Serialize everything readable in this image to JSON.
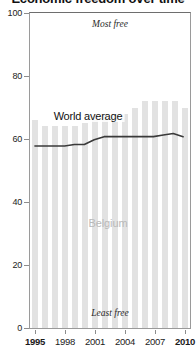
{
  "title": "Economic freedom over time",
  "chart_data": {
    "type": "bar",
    "title": "Economic freedom over time",
    "subtitle": "",
    "xlabel": "",
    "ylabel": "",
    "ylim": [
      0,
      100
    ],
    "xlim": [
      1994.5,
      2010.5
    ],
    "grid": false,
    "legend_position": "inline-annotations",
    "categories": [
      1995,
      1996,
      1997,
      1998,
      1999,
      2000,
      2001,
      2002,
      2003,
      2004,
      2005,
      2006,
      2007,
      2008,
      2009,
      2010
    ],
    "series": [
      {
        "name": "Belgium",
        "type": "bar",
        "color": "#e2e2e2",
        "values": [
          66,
          64,
          64,
          64,
          64,
          65,
          67,
          68,
          68,
          68,
          70,
          72,
          72,
          72,
          72,
          70
        ]
      },
      {
        "name": "World average",
        "type": "line",
        "color": "#3a3a3a",
        "values": [
          57.5,
          57.5,
          57.5,
          57.5,
          58,
          58,
          59.5,
          60.5,
          60.5,
          60.5,
          60.5,
          60.5,
          60.5,
          61,
          61.5,
          60.5
        ]
      }
    ],
    "annotations": [
      {
        "text": "Most free",
        "x": 2002.5,
        "y": 96,
        "style": "italic"
      },
      {
        "text": "Least free",
        "x": 2002.5,
        "y": 4,
        "style": "italic"
      },
      {
        "text": "World average",
        "x": 2000.3,
        "y": 67,
        "style": "series-label"
      },
      {
        "text": "Belgium",
        "x": 2002.3,
        "y": 33,
        "style": "country-label"
      }
    ],
    "yticks": [
      0,
      20,
      40,
      60,
      80,
      100
    ],
    "ytick_labels": [
      "0",
      "20",
      "40",
      "60",
      "80",
      "100"
    ],
    "xticks": [
      1995,
      1998,
      2001,
      2004,
      2007,
      2010
    ],
    "xtick_labels": [
      "1995",
      "1998",
      "2001",
      "2004",
      "2007",
      "2010"
    ],
    "xtick_bold": [
      "1995",
      "2010"
    ]
  },
  "colors": {
    "bar": "#e2e2e2",
    "line": "#3a3a3a",
    "frame": "#9a9a9a",
    "country_label": "#b9b9b9",
    "text": "#1a1a1a"
  }
}
